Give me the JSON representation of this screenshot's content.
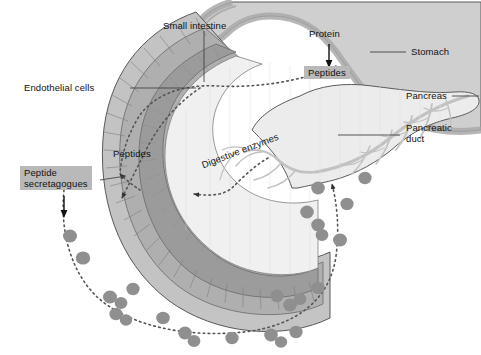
{
  "figure": {
    "background": "#ffffff"
  },
  "labels": {
    "small_intestine": "Small intestine",
    "endothelial_cells": "Endothelial cells",
    "stomach": "Stomach",
    "pancreas": "Pancreas",
    "pancreatic_duct": "Pancreatic\nduct",
    "protein": "Protein",
    "peptides_stomach": "Peptides",
    "peptides_intestine": "Peptides",
    "digestive_enzymes": "Digestive enzymes",
    "peptide_secretagogues": "Peptide\nsecretagogues"
  },
  "colors": {
    "outline": "#5a5a5a",
    "stomach_fill": "#cfcfcf",
    "stomach_wall": "#a9a9a9",
    "intestine_outer": "#c4c4c4",
    "intestine_muscle": "#b0b0b0",
    "intestine_mucosa": "#9d9d9d",
    "lumen_fill": "#f0f0f0",
    "pancreas_fill": "#ececec",
    "pancreas_duct": "#c9c9c9",
    "particle": "#8f8f8f",
    "highlight_box": "#b9b9b9",
    "dotted_path": "#555555",
    "leader_line": "#444444",
    "text": "#111111"
  },
  "annotations": {
    "flows": [
      {
        "name": "peptide-transport-path",
        "from": "stomach lumen",
        "to": "intestinal wall",
        "style": "dotted",
        "arrowheads": 2
      },
      {
        "name": "enzyme-secretion-path",
        "from": "pancreatic duct",
        "to": "intestinal lumen",
        "style": "dotted",
        "arrowheads": 1
      },
      {
        "name": "secretagogue-circulation-path",
        "from": "intestinal wall",
        "to": "pancreas",
        "style": "dotted",
        "arrowheads": 2
      }
    ],
    "particle_count": 25
  }
}
